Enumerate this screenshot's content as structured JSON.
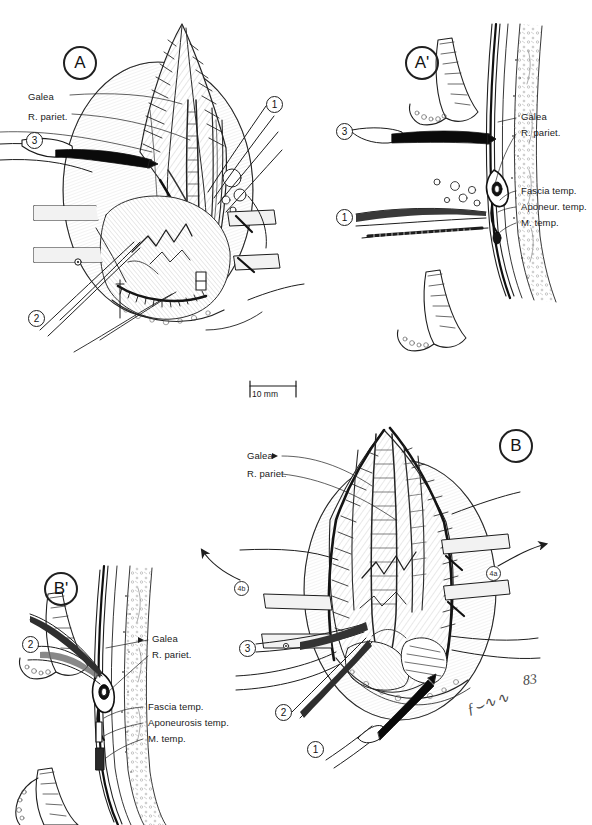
{
  "figure": {
    "scale_bar": {
      "label": "10 mm",
      "length_px": 46
    },
    "signature": {
      "artist_mark": "ƒ⌣∿∿",
      "year": "83"
    }
  },
  "panels": [
    {
      "id": "A",
      "letter": "A",
      "type": "surgical-field-view",
      "labels": [
        {
          "text": "Galea",
          "x": 28,
          "y": 97
        },
        {
          "text": "R. pariet.",
          "x": 28,
          "y": 117
        }
      ],
      "callouts": [
        {
          "num": "3",
          "x": 30,
          "y": 132
        },
        {
          "num": "1",
          "x": 268,
          "y": 97
        },
        {
          "num": "2",
          "x": 31,
          "y": 310
        }
      ]
    },
    {
      "id": "A'",
      "letter": "A'",
      "type": "cross-section-view",
      "labels": [
        {
          "text": "Galea",
          "x": 519,
          "y": 115
        },
        {
          "text": "R. pariet.",
          "x": 519,
          "y": 131
        },
        {
          "text": "Fascia temp.",
          "x": 519,
          "y": 188
        },
        {
          "text": "Aponeur. temp.",
          "x": 519,
          "y": 204
        },
        {
          "text": "M. temp.",
          "x": 519,
          "y": 220
        }
      ],
      "callouts": [
        {
          "num": "3",
          "x": 338,
          "y": 124
        },
        {
          "num": "1",
          "x": 338,
          "y": 209
        }
      ]
    },
    {
      "id": "B",
      "letter": "B",
      "type": "surgical-field-view",
      "labels": [
        {
          "text": "Galea",
          "x": 247,
          "y": 455
        },
        {
          "text": "R. pariet.",
          "x": 247,
          "y": 472
        }
      ],
      "callouts": [
        {
          "num": "3",
          "x": 243,
          "y": 644
        },
        {
          "num": "2",
          "x": 279,
          "y": 708
        },
        {
          "num": "1",
          "x": 311,
          "y": 744
        }
      ],
      "retraction_arrows": [
        {
          "id": "4b",
          "marker": "4b",
          "x": 232,
          "y": 581,
          "direction": "up-left"
        },
        {
          "id": "4a",
          "marker": "4a",
          "x": 484,
          "y": 570,
          "direction": "up-right"
        }
      ]
    },
    {
      "id": "B'",
      "letter": "B'",
      "type": "cross-section-view",
      "labels": [
        {
          "text": "Galea",
          "x": 152,
          "y": 637
        },
        {
          "text": "R. pariet.",
          "x": 152,
          "y": 653
        },
        {
          "text": "Fascia temp.",
          "x": 146,
          "y": 704
        },
        {
          "text": "Aponeurosis temp.",
          "x": 146,
          "y": 720
        },
        {
          "text": "M. temp.",
          "x": 146,
          "y": 736
        }
      ],
      "callouts": [
        {
          "num": "2",
          "x": 26,
          "y": 637
        }
      ]
    }
  ],
  "colors": {
    "ink": "#1a1a1a",
    "mid_ink": "#4a4a4a",
    "light_ink": "#8d8d8d",
    "shade": "#d9d9d9",
    "paper": "#ffffff"
  }
}
